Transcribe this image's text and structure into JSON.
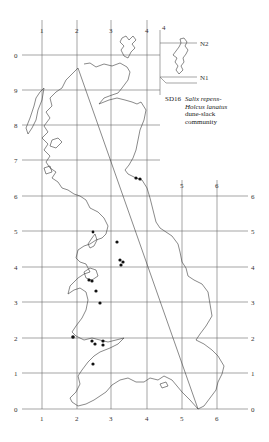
{
  "map": {
    "code": "SD16",
    "species_line1": "Salix repens-",
    "species_line2": "Holcus lanatus",
    "community_line1": "dune-slack",
    "community_line2": "community",
    "inset": {
      "col_label": "4",
      "north_labels": [
        "N2",
        "N1"
      ]
    },
    "grid": {
      "top_labels": [
        "1",
        "2",
        "3",
        "4"
      ],
      "inner_top_labels": [
        "5",
        "6"
      ],
      "left_labels": [
        "0",
        "9",
        "8",
        "7",
        "6",
        "5",
        "4",
        "3",
        "2",
        "1",
        "0"
      ],
      "right_labels": [
        "6",
        "5",
        "4",
        "3",
        "2",
        "1",
        "0"
      ],
      "bottom_labels": [
        "1",
        "2",
        "3",
        "4",
        "5",
        "6"
      ]
    },
    "colors": {
      "grid": "#6a6a6a",
      "coast": "#3a3a3a",
      "record": "#111111"
    },
    "records_count": 17
  }
}
